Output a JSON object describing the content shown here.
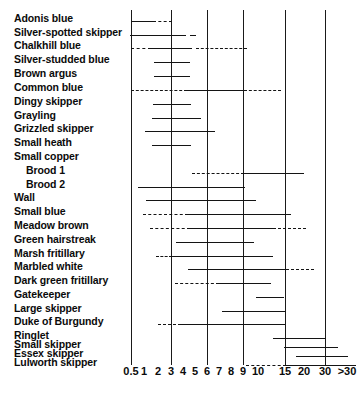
{
  "chart_data": {
    "type": "bar",
    "title": "",
    "subtitle": "",
    "xlabel": "",
    "ylabel": "",
    "orientation": "horizontal",
    "grid": true,
    "legend": null,
    "axis_scale": "ordinal-log-like",
    "x_tick_labels": [
      "0.5",
      "1",
      "2",
      "3",
      "4",
      "5",
      "6",
      "7",
      "8",
      "9",
      "10",
      "15",
      "20",
      "30",
      ">30"
    ],
    "x_tick_positions_px": [
      131,
      144,
      158,
      171,
      183,
      195,
      207,
      219,
      231,
      243,
      258,
      285,
      304,
      325,
      347
    ],
    "gridline_values": [
      "0.5",
      "3",
      "6",
      "9",
      "15",
      "30"
    ],
    "axis_tick_values": [
      "0.5",
      "3",
      "6",
      "9",
      "15",
      "30"
    ],
    "categories": [
      "Adonis blue",
      "Silver-spotted skipper",
      "Chalkhill blue",
      "Silver-studded blue",
      "Brown argus",
      "Common blue",
      "Dingy skipper",
      "Grayling",
      "Grizzled skipper",
      "Small heath",
      "Small copper",
      "Brood 1",
      "Brood 2",
      "Wall",
      "Small blue",
      "Meadow brown",
      "Green hairstreak",
      "Marsh fritillary",
      "Marbled white",
      "Dark green fritillary",
      "Gatekeeper",
      "Large skipper",
      "Duke of Burgundy",
      "Ringlet",
      "Small skipper",
      "Essex skipper",
      "Lulworth skipper"
    ],
    "rows": [
      {
        "label": "Adonis blue",
        "indent": false,
        "y": 21,
        "segments": [
          {
            "style": "solid",
            "x0": 131,
            "x1": 153
          },
          {
            "style": "dashed",
            "x0": 153,
            "x1": 172
          }
        ]
      },
      {
        "label": "Silver-spotted skipper",
        "indent": false,
        "y": 35,
        "segments": [
          {
            "style": "dashed",
            "x0": 130,
            "x1": 136
          },
          {
            "style": "solid",
            "x0": 136,
            "x1": 186
          },
          {
            "style": "dashed",
            "x0": 190,
            "x1": 196
          }
        ]
      },
      {
        "label": "Chalkhill blue",
        "indent": false,
        "y": 48,
        "segments": [
          {
            "style": "dashed",
            "x0": 131,
            "x1": 151
          },
          {
            "style": "solid",
            "x0": 151,
            "x1": 192
          },
          {
            "style": "dashed",
            "x0": 196,
            "x1": 247
          }
        ]
      },
      {
        "label": "Silver-studded blue",
        "indent": false,
        "y": 62,
        "segments": [
          {
            "style": "solid",
            "x0": 154,
            "x1": 190
          }
        ]
      },
      {
        "label": "Brown argus",
        "indent": false,
        "y": 76,
        "segments": [
          {
            "style": "solid",
            "x0": 154,
            "x1": 190
          }
        ]
      },
      {
        "label": "Common blue",
        "indent": false,
        "y": 90,
        "segments": [
          {
            "style": "dashed",
            "x0": 131,
            "x1": 187
          },
          {
            "style": "solid",
            "x0": 187,
            "x1": 244
          },
          {
            "style": "dashed",
            "x0": 244,
            "x1": 281
          }
        ]
      },
      {
        "label": "Dingy skipper",
        "indent": false,
        "y": 104,
        "segments": [
          {
            "style": "solid",
            "x0": 153,
            "x1": 191
          }
        ]
      },
      {
        "label": "Grayling",
        "indent": false,
        "y": 118,
        "segments": [
          {
            "style": "solid",
            "x0": 152,
            "x1": 201
          }
        ]
      },
      {
        "label": "Grizzled skipper",
        "indent": false,
        "y": 131,
        "segments": [
          {
            "style": "solid",
            "x0": 145,
            "x1": 215
          }
        ]
      },
      {
        "label": "Small heath",
        "indent": false,
        "y": 145,
        "segments": [
          {
            "style": "solid",
            "x0": 152,
            "x1": 191
          }
        ]
      },
      {
        "label": "Small copper",
        "indent": false,
        "y": 159,
        "segments": []
      },
      {
        "label": "Brood 1",
        "indent": true,
        "y": 173,
        "segments": [
          {
            "style": "dashed",
            "x0": 192,
            "x1": 244
          },
          {
            "style": "solid",
            "x0": 244,
            "x1": 304
          }
        ]
      },
      {
        "label": "Brood 2",
        "indent": true,
        "y": 187,
        "segments": [
          {
            "style": "solid",
            "x0": 138,
            "x1": 245
          }
        ]
      },
      {
        "label": "Wall",
        "indent": false,
        "y": 200,
        "segments": [
          {
            "style": "solid",
            "x0": 146,
            "x1": 256
          }
        ]
      },
      {
        "label": "Small blue",
        "indent": false,
        "y": 214,
        "segments": [
          {
            "style": "dashed",
            "x0": 143,
            "x1": 188
          },
          {
            "style": "solid",
            "x0": 188,
            "x1": 291
          }
        ]
      },
      {
        "label": "Meadow brown",
        "indent": false,
        "y": 228,
        "segments": [
          {
            "style": "dashed",
            "x0": 150,
            "x1": 190
          },
          {
            "style": "solid",
            "x0": 190,
            "x1": 273
          },
          {
            "style": "dashed",
            "x0": 273,
            "x1": 306
          }
        ]
      },
      {
        "label": "Green hairstreak",
        "indent": false,
        "y": 242,
        "segments": [
          {
            "style": "solid",
            "x0": 176,
            "x1": 254
          }
        ]
      },
      {
        "label": "Marsh fritillary",
        "indent": false,
        "y": 256,
        "segments": [
          {
            "style": "dashed",
            "x0": 156,
            "x1": 172
          },
          {
            "style": "solid",
            "x0": 172,
            "x1": 273
          }
        ]
      },
      {
        "label": "Marbled white",
        "indent": false,
        "y": 269,
        "segments": [
          {
            "style": "solid",
            "x0": 188,
            "x1": 286
          },
          {
            "style": "dashed",
            "x0": 286,
            "x1": 314
          }
        ]
      },
      {
        "label": "Dark green fritillary",
        "indent": false,
        "y": 283,
        "segments": [
          {
            "style": "dashed",
            "x0": 175,
            "x1": 219
          },
          {
            "style": "solid",
            "x0": 219,
            "x1": 271
          }
        ]
      },
      {
        "label": "Gatekeeper",
        "indent": false,
        "y": 297,
        "segments": [
          {
            "style": "solid",
            "x0": 256,
            "x1": 284
          }
        ]
      },
      {
        "label": "Large skipper",
        "indent": false,
        "y": 311,
        "segments": [
          {
            "style": "solid",
            "x0": 222,
            "x1": 286
          }
        ]
      },
      {
        "label": "Duke of Burgundy",
        "indent": false,
        "y": 324,
        "segments": [
          {
            "style": "dashed",
            "x0": 158,
            "x1": 181
          },
          {
            "style": "solid",
            "x0": 181,
            "x1": 285
          }
        ]
      },
      {
        "label": "Ringlet",
        "indent": false,
        "y": 338,
        "segments": [
          {
            "style": "solid",
            "x0": 273,
            "x1": 326
          }
        ]
      },
      {
        "label": "Small skipper",
        "indent": false,
        "y": 347,
        "segments": [
          {
            "style": "solid",
            "x0": 284,
            "x1": 338
          }
        ]
      },
      {
        "label": "Essex skipper",
        "indent": false,
        "y": 356,
        "segments": [
          {
            "style": "solid",
            "x0": 296,
            "x1": 348
          }
        ]
      },
      {
        "label": "Lulworth skipper",
        "indent": false,
        "y": 365,
        "segments": [
          {
            "style": "dashed",
            "x0": 246,
            "x1": 286
          },
          {
            "style": "solid",
            "x0": 286,
            "x1": 356
          }
        ]
      }
    ]
  },
  "styling": {
    "line_color": "#141414",
    "grid_color": "#1a1a1a",
    "text_color": "#0b0b0b",
    "background": "#ffffff"
  }
}
